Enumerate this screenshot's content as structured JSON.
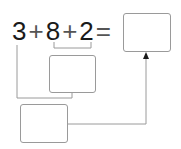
{
  "equation": {
    "terms": [
      "3",
      "+",
      "8",
      "+",
      "2",
      "="
    ]
  },
  "boxes": {
    "result": {
      "value": ""
    },
    "partial_sum": {
      "value": ""
    },
    "total": {
      "value": ""
    }
  },
  "colors": {
    "line": "#9a9a9a",
    "text": "#1a1a1a",
    "arrow": "#1a1a1a"
  }
}
